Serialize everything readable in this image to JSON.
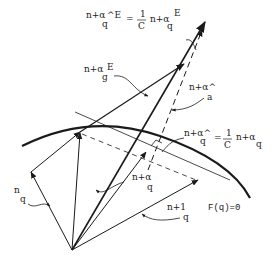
{
  "diagram": {
    "colors": {
      "line": "#1a1a1a",
      "background": "#ffffff"
    },
    "labels": {
      "q_hat_E_eq": {
        "prefix": "n+α",
        "sym": "q",
        "sup": "^E",
        "equals": "=",
        "frac_num": "1",
        "frac_den": "C",
        "rhs_prefix": "n+α",
        "rhs_sym": "q",
        "rhs_sup": "E"
      },
      "q_E": {
        "prefix": "n+α",
        "sym": "g",
        "sup": "E"
      },
      "a_hat": {
        "prefix": "n+α^",
        "sym": "a"
      },
      "q_hat_eq": {
        "prefix": "n+α^",
        "sym": "q",
        "equals": "=",
        "frac_num": "1",
        "frac_den": "C",
        "rhs_prefix": "n+α",
        "rhs_sym": "q"
      },
      "q_n": {
        "prefix": "n",
        "sym": "q"
      },
      "q_n_alpha": {
        "prefix": "n+α",
        "sym": "q"
      },
      "q_n_1": {
        "prefix": "n+1",
        "sym": "q"
      },
      "constraint": "F(q)=0"
    }
  }
}
